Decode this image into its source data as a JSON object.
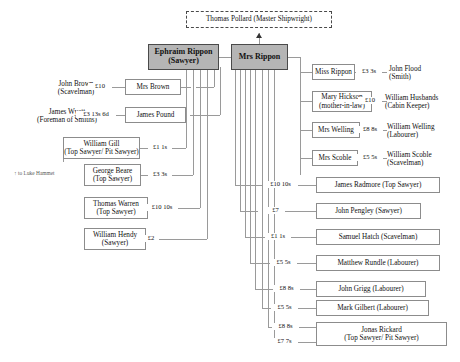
{
  "diagram": {
    "title_box": {
      "label": "Thomas Pollard (Master Shipwright)"
    },
    "principals": [
      {
        "id": "ephraim",
        "line1": "Ephraim Rippon",
        "line2": "(Sawyer)"
      },
      {
        "id": "mrs-rippon",
        "line1": "Mrs Rippon",
        "line2": ""
      }
    ],
    "left_nodes": [
      {
        "id": "mrs-brown",
        "line1": "Mrs Brown",
        "line2": ""
      },
      {
        "id": "james-pound",
        "line1": "James Pound",
        "line2": ""
      },
      {
        "id": "william-gill",
        "line1": "William Gill",
        "line2": "(Top Sawyer/ Pit Sawyer)"
      },
      {
        "id": "george-beare",
        "line1": "George Beare",
        "line2": "(Top Sawyer)"
      },
      {
        "id": "thomas-warren",
        "line1": "Thomas Warren",
        "line2": "(Top Sawyer)"
      },
      {
        "id": "william-hendy",
        "line1": "William Hendy",
        "line2": "(Sawyer)"
      }
    ],
    "left_outer_labels": [
      {
        "id": "john-brown",
        "line1": "John Brown",
        "line2": "(Scavelman)"
      },
      {
        "id": "james-wyatt",
        "line1": "James Wyatt",
        "line2": "(Foreman of Smiths)"
      }
    ],
    "left_amounts": [
      {
        "id": "amt-john-brown",
        "value": "£10"
      },
      {
        "id": "amt-james-wyatt",
        "value": "£3 13s 6d"
      },
      {
        "id": "amt-william-gill",
        "value": "£1 1s"
      },
      {
        "id": "amt-george-beare",
        "value": "£3 3s"
      },
      {
        "id": "amt-thomas-warren",
        "value": "£10 10s"
      },
      {
        "id": "amt-william-hendy",
        "value": "£2"
      }
    ],
    "right_nodes": [
      {
        "id": "miss-rippon",
        "line1": "Miss Rippon",
        "line2": ""
      },
      {
        "id": "mary-hickson",
        "line1": "Mary Hickson",
        "line2": "(mother-in-law)"
      },
      {
        "id": "mrs-welling",
        "line1": "Mrs Welling",
        "line2": ""
      },
      {
        "id": "mrs-scoble",
        "line1": "Mrs Scoble",
        "line2": ""
      }
    ],
    "right_outer_labels": [
      {
        "id": "john-flood",
        "line1": "John Flood",
        "line2": "(Smith)"
      },
      {
        "id": "william-husbands",
        "line1": "William Husbands",
        "line2": "(Cabin Keeper)"
      },
      {
        "id": "william-welling",
        "line1": "William Welling",
        "line2": "(Labourer)"
      },
      {
        "id": "william-scoble",
        "line1": "William Scoble",
        "line2": "(Scavelman)"
      }
    ],
    "right_outer_amounts": [
      {
        "id": "amt-john-flood",
        "value": "£3 3s"
      },
      {
        "id": "amt-william-husbands",
        "value": "£10"
      },
      {
        "id": "amt-william-welling",
        "value": "£8 8s"
      },
      {
        "id": "amt-william-scoble",
        "value": "£5 5s"
      }
    ],
    "beneficiaries": [
      {
        "id": "james-radmore",
        "label": "James Radmore (Top Sawyer)",
        "amount": "£10 10s"
      },
      {
        "id": "john-pengley",
        "label": "John Pengley (Sawyer)",
        "amount": "£7"
      },
      {
        "id": "samuel-hatch",
        "label": "Samuel Hatch (Scavelman)",
        "amount": "£1 1s"
      },
      {
        "id": "matthew-rundle",
        "label": "Matthew Rundle (Labourer)",
        "amount": "£5 5s"
      },
      {
        "id": "john-grigg",
        "label": "John Grigg (Labourer)",
        "amount": "£8 8s"
      },
      {
        "id": "mark-gilbert",
        "label": "Mark Gilbert (Labourer)",
        "amount": "£5 5s"
      }
    ],
    "final_node": {
      "id": "jonas-rickard",
      "line1": "Jonas Rickard",
      "line2": "(Top Sawyer/ Pit Sawyer)",
      "amount_top": "£8 8s",
      "amount_bottom": "£7 7s"
    },
    "annotation": {
      "id": "luke-hammet-note",
      "text": "↑ to Luke Hammet"
    }
  }
}
